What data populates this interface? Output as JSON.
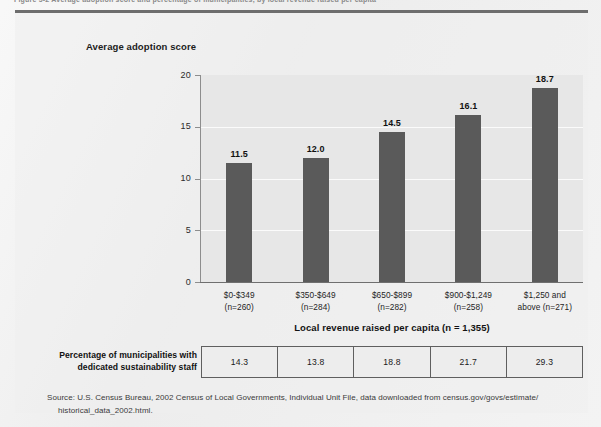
{
  "figure": {
    "caption": "Figure 5-2   Average adoption score and percentage of municipalities, by local revenue raised per capita"
  },
  "chart_data": {
    "type": "bar",
    "title": "Average adoption score",
    "xlabel": "Local revenue raised per capita (n = 1,355)",
    "ylabel": "Average adoption score",
    "ylim": [
      0,
      20
    ],
    "yticks": [
      "0",
      "5",
      "10",
      "15",
      "20"
    ],
    "grid": true,
    "legend": "none",
    "categories": [
      "$0-$349\n(n=260)",
      "$350-$649\n(n=284)",
      "$650-$899\n(n=282)",
      "$900-$1,249\n(n=258)",
      "$1,250 and\nabove (n=271)"
    ],
    "category_lines": [
      [
        "$0-$349",
        "(n=260)"
      ],
      [
        "$350-$649",
        "(n=284)"
      ],
      [
        "$650-$899",
        "(n=282)"
      ],
      [
        "$900-$1,249",
        "(n=258)"
      ],
      [
        "$1,250 and",
        "above (n=271)"
      ]
    ],
    "values": [
      11.5,
      12.0,
      14.5,
      16.1,
      18.7
    ],
    "value_labels": [
      "11.5",
      "12.0",
      "14.5",
      "16.1",
      "18.7"
    ],
    "bar_color": "#5a5a5a",
    "plot_background": "#e7e7e7",
    "gridline_color": "#fbfbfb"
  },
  "table": {
    "row_label_line1": "Percentage of municipalities with",
    "row_label_line2": "dedicated sustainability staff",
    "values": [
      "14.3",
      "13.8",
      "18.8",
      "21.7",
      "29.3"
    ]
  },
  "source": {
    "line1": "Source: U.S. Census Bureau, 2002 Census of Local Governments, Individual Unit File, data downloaded from census.gov/govs/estimate/",
    "line2": "historical_data_2002.html."
  }
}
